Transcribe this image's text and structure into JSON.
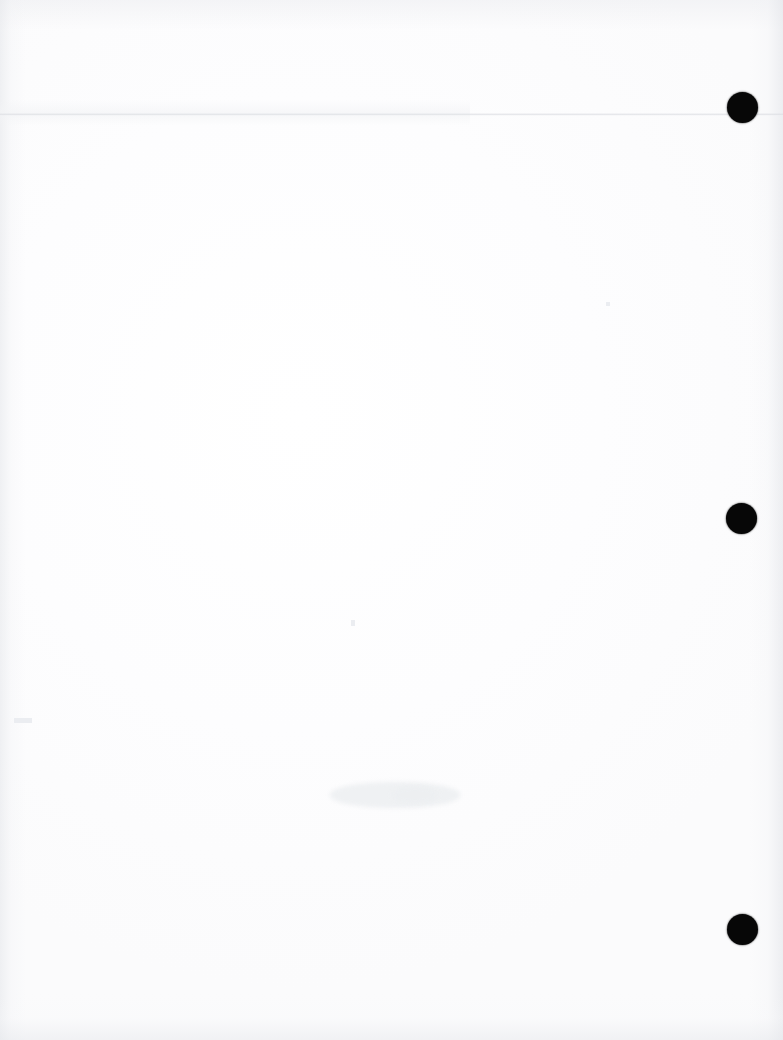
{
  "document": {
    "kind": "scanned-page",
    "page_state": "blank",
    "page_width": 783,
    "page_height": 1040,
    "visible_text": "",
    "background_color": "#ffffff",
    "paper_tone": "#fdfdfe",
    "ink_color": "#070707",
    "caption": ""
  },
  "artifacts": {
    "punch_holes": {
      "name": "three-hole-punch",
      "count": 3,
      "color": "#070707",
      "edge": "right",
      "holes": [
        {
          "label": "top-punch-hole",
          "x": 727,
          "y": 92,
          "diameter": 31
        },
        {
          "label": "middle-punch-hole",
          "x": 726,
          "y": 503,
          "diameter": 31
        },
        {
          "label": "bottom-punch-hole",
          "x": 727,
          "y": 914,
          "diameter": 31
        }
      ]
    },
    "crease": {
      "label": "horizontal-crease-line",
      "y": 113,
      "color": "#dbdde2"
    },
    "show_through": [
      {
        "label": "center-show-through",
        "x": 330,
        "y": 782,
        "width": 130,
        "height": 26
      },
      {
        "label": "center-show-through-secondary",
        "x": 392,
        "y": 786,
        "width": 46,
        "height": 18
      }
    ],
    "specks": [
      {
        "label": "left-margin-speck",
        "x": 14,
        "y": 718,
        "size": 5
      },
      {
        "label": "center-speck",
        "x": 352,
        "y": 621,
        "size": 4
      },
      {
        "label": "upper-right-speck",
        "x": 606,
        "y": 302,
        "size": 3
      }
    ]
  }
}
